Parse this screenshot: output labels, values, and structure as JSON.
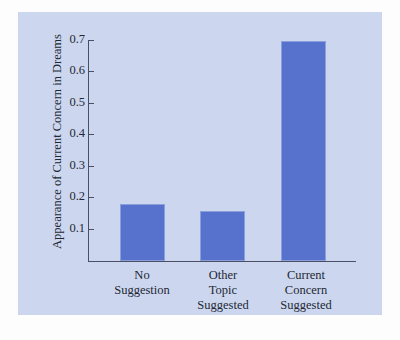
{
  "figure": {
    "panel_color": "#ccd7ef",
    "page_color": "#fdfdfd",
    "axis_color": "#4a4f63"
  },
  "chart_data": {
    "type": "bar",
    "title": "",
    "xlabel": "",
    "ylabel": "Appearance of Current Concern in Dreams",
    "categories": [
      "No\nSuggestion",
      "Other\nTopic\nSuggested",
      "Current\nConcern\nSuggested"
    ],
    "category_lines": [
      [
        "No",
        "Suggestion"
      ],
      [
        "Other",
        "Topic",
        "Suggested"
      ],
      [
        "Current",
        "Concern",
        "Suggested"
      ]
    ],
    "values": [
      0.18,
      0.16,
      0.7
    ],
    "ylim": [
      0,
      0.75
    ],
    "yticks": [
      0.1,
      0.2,
      0.3,
      0.4,
      0.5,
      0.6,
      0.7
    ],
    "ytick_labels": [
      "0.1",
      "0.2",
      "0.3",
      "0.4",
      "0.5",
      "0.6",
      "0.7"
    ],
    "bar_color": "#5672cc",
    "bar_edge_color": "#8c9fdd",
    "grid": false,
    "legend": null
  }
}
